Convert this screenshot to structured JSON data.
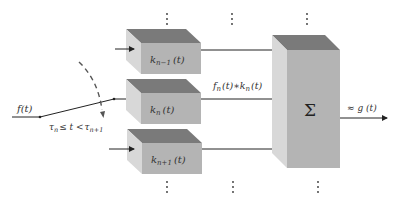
{
  "diagram": {
    "input_label": "f(t)",
    "switch_condition": {
      "tau_n": "τ",
      "sub_n": "n",
      "rel": "≤ t <",
      "tau_n1": "τ",
      "sub_n1": "n+1"
    },
    "filters": [
      {
        "name": "k",
        "sub": "n−1",
        "arg": "(t)"
      },
      {
        "name": "k",
        "sub": "n",
        "arg": "(t)"
      },
      {
        "name": "k",
        "sub": "n+1",
        "arg": "(t)"
      }
    ],
    "intermediate_label": {
      "f": "f",
      "f_sub": "n",
      "f_arg": "(t)∗k",
      "k_sub": "n",
      "k_arg": "(t)"
    },
    "summation_symbol": "Σ",
    "output_label": "≈ g (t)",
    "ellipsis": "⋮",
    "colors": {
      "front_face": "#b4b4b4",
      "side_face": "#d8d8d8",
      "top_face": "#7a7a7a",
      "line": "#222222"
    }
  }
}
